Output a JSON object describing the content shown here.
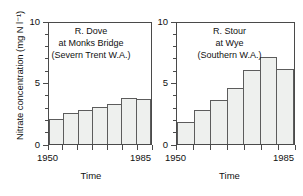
{
  "figure": {
    "ylabel": "Nitrate concentration (mg N l⁻¹)",
    "xlabel": "Time"
  },
  "axis": {
    "y_major_ticks": [
      "0",
      "5",
      "10"
    ],
    "y_min": 0,
    "y_max": 10,
    "x_ticks": [
      "1950",
      "1985"
    ],
    "x_min": 1950,
    "x_max": 1985
  },
  "chart_data": [
    {
      "type": "bar",
      "title": "R. Dove\nat Monks Bridge\n(Severn Trent W.A.)",
      "title_lines": [
        "R. Dove",
        "at Monks Bridge",
        "(Severn Trent W.A.)"
      ],
      "categories": [
        "1950",
        "1955",
        "1960",
        "1965",
        "1970",
        "1975",
        "1980"
      ],
      "x": [
        1950,
        1955,
        1960,
        1965,
        1970,
        1975,
        1980
      ],
      "values": [
        2.1,
        2.6,
        2.8,
        3.1,
        3.3,
        3.8,
        3.7
      ],
      "xlabel": "Time",
      "ylabel": "Nitrate concentration (mg N l⁻¹)",
      "ylim": [
        0,
        10
      ],
      "xlim": [
        1950,
        1985
      ],
      "grid": false,
      "legend": false,
      "bar_fill": "#eef0ee",
      "bar_edge": "#5c5c5c"
    },
    {
      "type": "bar",
      "title": "R. Stour\nat Wye\n(Southern W.A.)",
      "title_lines": [
        "R. Stour",
        "at Wye",
        "(Southern W.A.)"
      ],
      "categories": [
        "1950",
        "1955",
        "1960",
        "1965",
        "1970",
        "1975",
        "1980"
      ],
      "x": [
        1950,
        1955,
        1960,
        1965,
        1970,
        1975,
        1980
      ],
      "values": [
        1.8,
        2.8,
        3.6,
        4.6,
        6.1,
        7.2,
        6.2
      ],
      "xlabel": "Time",
      "ylabel": "Nitrate concentration (mg N l⁻¹)",
      "ylim": [
        0,
        10
      ],
      "xlim": [
        1950,
        1985
      ],
      "grid": false,
      "legend": false,
      "bar_fill": "#eef0ee",
      "bar_edge": "#5c5c5c"
    }
  ],
  "colors": {
    "axis": "#4a4a4a",
    "bar_fill": "#eef0ee",
    "bar_edge": "#5c5c5c",
    "text": "#111111"
  }
}
